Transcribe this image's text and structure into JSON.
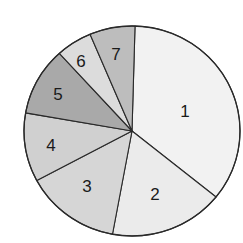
{
  "chart_data": {
    "type": "pie",
    "title": "",
    "categories": [
      "1",
      "2",
      "3",
      "4",
      "5",
      "6",
      "7"
    ],
    "values": [
      35.4,
      17.1,
      14.3,
      10.6,
      10.5,
      5.4,
      6.8
    ],
    "unit": "percent (estimated from slice angles)",
    "start_angle_deg": 1.6,
    "direction": "clockwise",
    "legend": "none (labels inside slices)",
    "colors": [
      "#f2f2f2",
      "#ebebeb",
      "#d6d6d6",
      "#d0d0d0",
      "#a9a9a9",
      "#dcdcdc",
      "#bdbdbd"
    ],
    "label_positions": [
      [
        185,
        111
      ],
      [
        155,
        194
      ],
      [
        87,
        186
      ],
      [
        51,
        145
      ],
      [
        58,
        94
      ],
      [
        81,
        61
      ],
      [
        116,
        54
      ]
    ]
  },
  "geometry": {
    "cx": 132,
    "cy": 131,
    "rx": 108,
    "ry": 105,
    "stroke": "#2a2a2a"
  }
}
